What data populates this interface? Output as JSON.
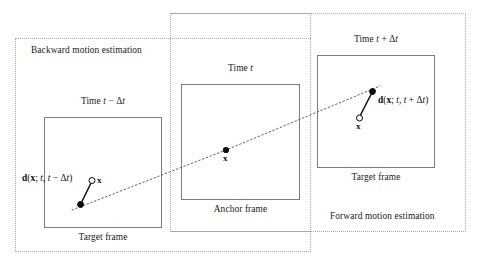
{
  "figure": {
    "width": 481,
    "height": 269,
    "background": "#ffffff",
    "line_color": "#7c7c7c",
    "dashed_region_color": "#a8a8a8",
    "marker_color": "#0d0d0d"
  },
  "regions": [
    {
      "id": "backward",
      "label": "Backward motion estimation"
    },
    {
      "id": "anchor",
      "label": ""
    },
    {
      "id": "forward",
      "label": "Forward motion estimation"
    }
  ],
  "frames": [
    {
      "id": "previous",
      "time_label": "Time t − Δt",
      "time_prefix": "Time ",
      "time_var": "t",
      "time_op": " − Δ",
      "time_var2": "t",
      "caption": "Target frame"
    },
    {
      "id": "current",
      "time_label": "Time t",
      "time_prefix": "Time ",
      "time_var": "t",
      "time_op": "",
      "time_var2": "",
      "caption": "Anchor frame"
    },
    {
      "id": "next",
      "time_label": "Time t + Δt",
      "time_prefix": "Time ",
      "time_var": "t",
      "time_op": " + Δ",
      "time_var2": "t",
      "caption": "Target frame"
    }
  ],
  "vectors": [
    {
      "id": "backward",
      "label": "d(x; t, t − Δt)",
      "parts": {
        "d": "d",
        "open_paren": "(",
        "x": "x",
        "semicolon": "; ",
        "t1": "t",
        "comma": ", ",
        "t2": "t",
        "op": " − Δ",
        "t3": "t",
        "close_paren": ")"
      }
    },
    {
      "id": "forward",
      "label": "d(x; t, t + Δt)",
      "parts": {
        "d": "d",
        "open_paren": "(",
        "x": "x",
        "semicolon": "; ",
        "t1": "t",
        "comma": ", ",
        "t2": "t",
        "op": " + Δ",
        "t3": "t",
        "close_paren": ")"
      }
    }
  ],
  "points": [
    {
      "id": "previous",
      "label": "x",
      "marker": "open-circle"
    },
    {
      "id": "current",
      "label": "x",
      "marker": "filled-dot"
    },
    {
      "id": "next",
      "label": "x",
      "marker": "open-circle"
    }
  ],
  "trajectory": {
    "style": "dotted",
    "description": "motion trajectory through x across the three frames"
  }
}
